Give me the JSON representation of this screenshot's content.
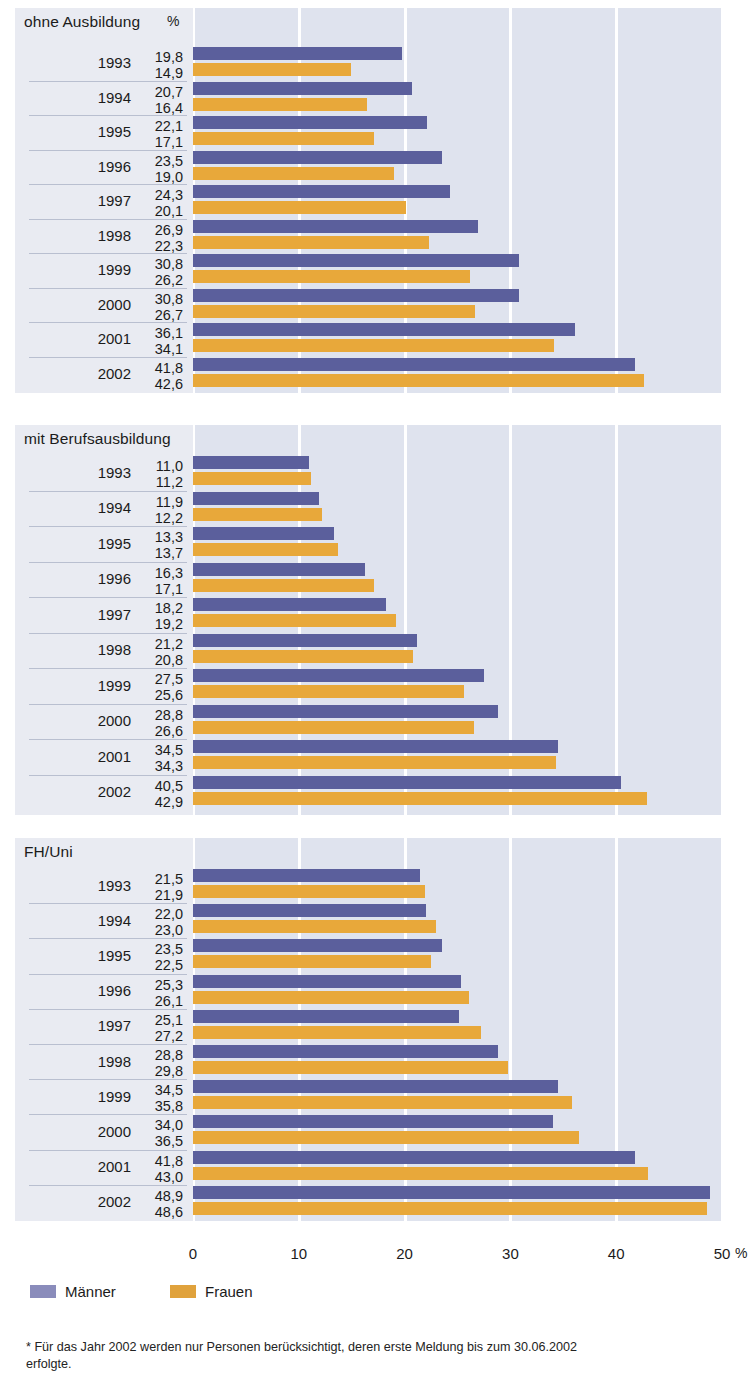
{
  "chart_data": {
    "type": "bar",
    "orientation": "horizontal",
    "title": "",
    "xlabel": "%",
    "ylabel": "",
    "xlim": [
      0,
      50
    ],
    "xticks": [
      "0",
      "10",
      "20",
      "30",
      "40",
      "50"
    ],
    "xtick_values": [
      0,
      10,
      20,
      30,
      40,
      50
    ],
    "xunit": "%",
    "grid": true,
    "legend_position": "bottom-left",
    "legend": [
      "Männer",
      "Frauen"
    ],
    "series_colors": {
      "maenner": "#5b5f9c",
      "frauen": "#e8a83a"
    },
    "categories": [
      "1993",
      "1994",
      "1995",
      "1996",
      "1997",
      "1998",
      "1999",
      "2000",
      "2001",
      "2002"
    ],
    "panels": [
      {
        "title": "ohne Ausbildung",
        "unit_label": "%",
        "categories": [
          "1993",
          "1994",
          "1995",
          "1996",
          "1997",
          "1998",
          "1999",
          "2000",
          "2001",
          "2002"
        ],
        "series": [
          {
            "name": "Männer",
            "values": [
              19.8,
              20.7,
              22.1,
              23.5,
              24.3,
              26.9,
              30.8,
              30.8,
              36.1,
              41.8
            ],
            "labels": [
              "19,8",
              "20,7",
              "22,1",
              "23,5",
              "24,3",
              "26,9",
              "30,8",
              "30,8",
              "36,1",
              "41,8"
            ]
          },
          {
            "name": "Frauen",
            "values": [
              14.9,
              16.4,
              17.1,
              19.0,
              20.1,
              22.3,
              26.2,
              26.7,
              34.1,
              42.6
            ],
            "labels": [
              "14,9",
              "16,4",
              "17,1",
              "19,0",
              "20,1",
              "22,3",
              "26,2",
              "26,7",
              "34,1",
              "42,6"
            ]
          }
        ]
      },
      {
        "title": "mit Berufsausbildung",
        "unit_label": "",
        "categories": [
          "1993",
          "1994",
          "1995",
          "1996",
          "1997",
          "1998",
          "1999",
          "2000",
          "2001",
          "2002"
        ],
        "series": [
          {
            "name": "Männer",
            "values": [
              11.0,
              11.9,
              13.3,
              16.3,
              18.2,
              21.2,
              27.5,
              28.8,
              34.5,
              40.5
            ],
            "labels": [
              "11,0",
              "11,9",
              "13,3",
              "16,3",
              "18,2",
              "21,2",
              "27,5",
              "28,8",
              "34,5",
              "40,5"
            ]
          },
          {
            "name": "Frauen",
            "values": [
              11.2,
              12.2,
              13.7,
              17.1,
              19.2,
              20.8,
              25.6,
              26.6,
              34.3,
              42.9
            ],
            "labels": [
              "11,2",
              "12,2",
              "13,7",
              "17,1",
              "19,2",
              "20,8",
              "25,6",
              "26,6",
              "34,3",
              "42,9"
            ]
          }
        ]
      },
      {
        "title": "FH/Uni",
        "unit_label": "",
        "categories": [
          "1993",
          "1994",
          "1995",
          "1996",
          "1997",
          "1998",
          "1999",
          "2000",
          "2001",
          "2002"
        ],
        "series": [
          {
            "name": "Männer",
            "values": [
              21.5,
              22.0,
              23.5,
              25.3,
              25.1,
              28.8,
              34.5,
              34.0,
              41.8,
              48.9
            ],
            "labels": [
              "21,5",
              "22,0",
              "23,5",
              "25,3",
              "25,1",
              "28,8",
              "34,5",
              "34,0",
              "41,8",
              "48,9"
            ]
          },
          {
            "name": "Frauen",
            "values": [
              21.9,
              23.0,
              22.5,
              26.1,
              27.2,
              29.8,
              35.8,
              36.5,
              43.0,
              48.6
            ],
            "labels": [
              "21,9",
              "23,0",
              "22,5",
              "26,1",
              "27,2",
              "29,8",
              "35,8",
              "36,5",
              "43,0",
              "48,6"
            ]
          }
        ]
      }
    ]
  },
  "footnote": {
    "line1": "* Für das Jahr 2002 werden nur Personen berücksichtigt, deren erste Meldung bis zum 30.06.2002",
    "line2": "erfolgte."
  }
}
